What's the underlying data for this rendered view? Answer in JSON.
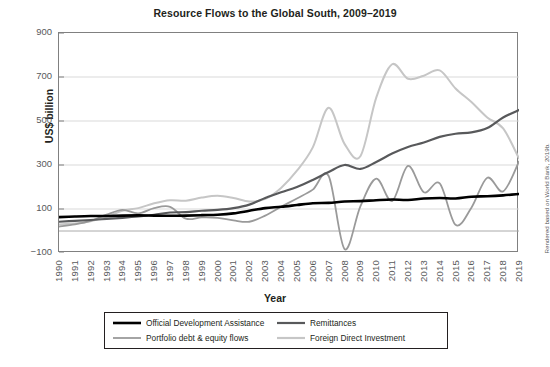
{
  "chart_data": {
    "type": "line",
    "title": "Resource Flows to the Global South, 2009–2019",
    "xlabel": "Year",
    "ylabel": "US$ billion",
    "source_note": "Rendered based on World Bank, 2019b.",
    "grid": true,
    "legend_position": "bottom",
    "xlim": [
      1990,
      2019
    ],
    "ylim": [
      -100,
      900
    ],
    "yticks": [
      -100,
      100,
      300,
      500,
      700,
      900
    ],
    "ytick_labels": [
      "−100",
      "100",
      "300",
      "500",
      "700",
      "900"
    ],
    "x": [
      1990,
      1991,
      1992,
      1993,
      1994,
      1995,
      1996,
      1997,
      1998,
      1999,
      2000,
      2001,
      2002,
      2003,
      2004,
      2005,
      2006,
      2007,
      2008,
      2009,
      2010,
      2011,
      2012,
      2013,
      2014,
      2015,
      2016,
      2017,
      2018,
      2019
    ],
    "categories": [
      "1990",
      "1991",
      "1992",
      "1993",
      "1994",
      "1995",
      "1996",
      "1997",
      "1998",
      "1999",
      "2000",
      "2001",
      "2002",
      "2003",
      "2004",
      "2005",
      "2006",
      "2007",
      "2008",
      "2009",
      "2010",
      "2011",
      "2012",
      "2013",
      "2014",
      "2015",
      "2016",
      "2017",
      "2018",
      "2019"
    ],
    "series": [
      {
        "name": "Official Development Assistance",
        "color": "#000000",
        "width": 2.6,
        "values": [
          63,
          66,
          68,
          68,
          70,
          71,
          70,
          69,
          70,
          72,
          74,
          80,
          92,
          104,
          110,
          118,
          126,
          128,
          134,
          136,
          140,
          143,
          141,
          148,
          150,
          148,
          156,
          158,
          162,
          168
        ]
      },
      {
        "name": "Remittances",
        "color": "#58595b",
        "width": 2.2,
        "values": [
          42,
          46,
          50,
          55,
          60,
          66,
          74,
          84,
          86,
          92,
          96,
          104,
          120,
          150,
          176,
          200,
          232,
          268,
          300,
          282,
          314,
          352,
          382,
          402,
          428,
          442,
          448,
          468,
          516,
          550
        ]
      },
      {
        "name": "Portfolio debt & equity flows",
        "color": "#9a9a9a",
        "width": 1.8,
        "values": [
          20,
          30,
          46,
          74,
          96,
          80,
          104,
          110,
          56,
          62,
          60,
          48,
          42,
          70,
          110,
          148,
          188,
          250,
          -82,
          112,
          238,
          136,
          296,
          176,
          216,
          28,
          106,
          242,
          180,
          316
        ]
      },
      {
        "name": "Foreign Direct Investment",
        "color": "#c6c6c6",
        "width": 2.0,
        "values": [
          30,
          34,
          44,
          66,
          92,
          104,
          126,
          140,
          138,
          152,
          160,
          150,
          134,
          146,
          196,
          274,
          380,
          560,
          396,
          340,
          606,
          758,
          692,
          706,
          730,
          648,
          586,
          516,
          466,
          330
        ]
      }
    ]
  },
  "axes": {
    "y_title": "US$ billion",
    "x_title": "Year"
  },
  "legend": {
    "items": [
      {
        "label": "Official Development Assistance",
        "color": "#000000",
        "width": 2.6
      },
      {
        "label": "Remittances",
        "color": "#58595b",
        "width": 2.2
      },
      {
        "label": "Portfolio debt & equity flows",
        "color": "#9a9a9a",
        "width": 1.8
      },
      {
        "label": "Foreign Direct Investment",
        "color": "#c6c6c6",
        "width": 2.0
      }
    ]
  }
}
